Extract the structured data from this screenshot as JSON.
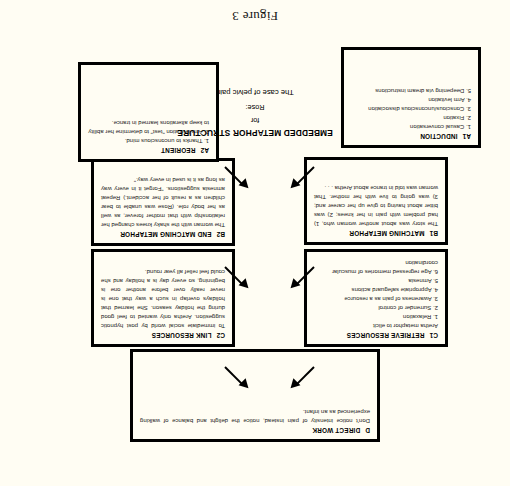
{
  "figure": {
    "caption": "Figure 3",
    "orientation_note": "page scanned upside-down (rotated 180 degrees)"
  },
  "center_title": {
    "line1": "EMBEDDED METAPHOR STRUCTURE",
    "line2": "for",
    "line3": "Rose:",
    "line4": "The case of pelvic pain"
  },
  "boxes": {
    "a1": {
      "code": "A1",
      "title": "INDUCTION",
      "items": [
        "1.  Casual conversation",
        "2.  Fixation",
        "3.  Conscious/unconscious dissociation",
        "4.  Arm levitation",
        "5.  Deepening via dream instructions"
      ]
    },
    "a2": {
      "code": "A2",
      "title": "REORIENT",
      "items": [
        "1.  Thanks to unconscious mind.",
        "2.  Arm levitation \"test\" to determine her ability to keep alterations learned in trance."
      ]
    },
    "b1": {
      "code": "B1",
      "title": "MATCHING METAPHOR",
      "text": "The story was about another woman who, 1) had problem with pain in her knees; 2) was bitter about having to give up her career and; 3) was going to live with her mother.  That woman was told in trance about Aretha . . ."
    },
    "b2": {
      "code": "B2",
      "title": "END MATCHING METAPHOR",
      "text": "The woman with the shaky knees changed her relationship with that mother forever, as well as her body role.  (Rose was unable to bear children as a result of her accident.)  Repeat amnesia suggestions.  \"Forget it in every way as long as it is used in every way.\""
    },
    "c1": {
      "code": "C1",
      "title": "RETRIEVE RESOURCES",
      "lead": "Aretha metaphor to elicit",
      "items": [
        "1.  Relaxation",
        "2.  Surrender of control",
        "3.  Awareness of pain as a resource",
        "4.  Appropriate safeguard actions",
        "5.  Amnesia",
        "6.  Age regressed memories of muscular coordination"
      ]
    },
    "c2": {
      "code": "C2",
      "title": "LINK RESOURCES",
      "text": "To immediate social world by post hypnotic suggestion.  Aretha only wanted to feel good during the holiday season.  She learned that holidays overlap in such a way that one is never really over before another one is beginning, so every day is a holiday and she could feel relief all year round."
    },
    "d": {
      "code": "D",
      "title": "DIRECT WORK",
      "text": "Don't notice intensity of pain instead, notice the delight and balance of walking experienced as an infant."
    }
  },
  "arrows": [
    {
      "name": "a1-to-b1",
      "direction": "up-right"
    },
    {
      "name": "b1-to-c1",
      "direction": "up-right"
    },
    {
      "name": "c1-to-d",
      "direction": "up-right"
    },
    {
      "name": "a2-to-b2",
      "direction": "up-left"
    },
    {
      "name": "b2-to-c2",
      "direction": "up-left"
    },
    {
      "name": "c2-to-d",
      "direction": "up-left"
    }
  ],
  "colors": {
    "page_background": "#fffdf3",
    "ink": "#000000",
    "body_text": "#1a1a1a"
  }
}
